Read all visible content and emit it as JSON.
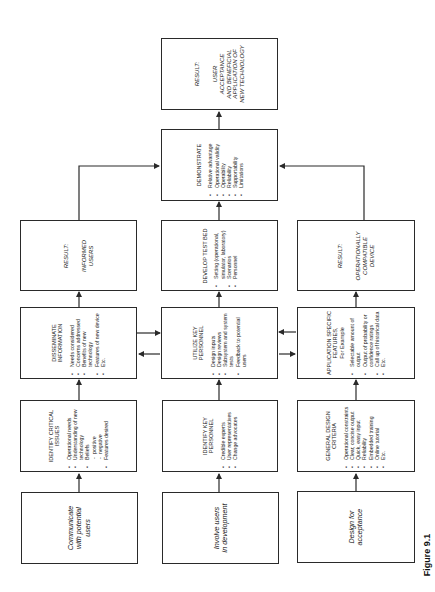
{
  "figure": {
    "orientation": "rotated 90 degrees counter-clockwise",
    "caption": "Figure 9.1"
  },
  "boxes": {
    "final_result": {
      "label": "RESULT:",
      "text": [
        "USER",
        "ACCEPTANCE",
        "AND BENEFICIAL",
        "APPLICATION OF",
        "NEW TECHNOLOGY"
      ]
    },
    "demonstrate": {
      "title": "DEMONSTRATE",
      "items": [
        "Relative advantage",
        "Operational validity",
        "Operability",
        "Reliability",
        "Supportability",
        "Limitations"
      ]
    },
    "result_informed": {
      "label": "RESULT:",
      "text": [
        "INFORMED",
        "USERS"
      ]
    },
    "develop_test_bed": {
      "title": "DEVELOP TEST BED",
      "items": [
        "Setting (operational, simulator, laboratory)",
        "Scenarios",
        "Personnel"
      ]
    },
    "result_compatible": {
      "label": "RESULT:",
      "text": [
        "OPERATIONALLY",
        "COMPATIBLE",
        "DEVICE"
      ]
    },
    "disseminate": {
      "title": "DISSEMINATE INFORMATION",
      "items": [
        "Needs considered",
        "Concerns addressed",
        "Benefits of new technology",
        "Features of new device",
        "Etc."
      ]
    },
    "utilize_key": {
      "title": "UTILIZE KEY PERSONNEL",
      "items": [
        "Design inputs",
        "Design reviews",
        "Subsystem and system tests",
        "Feedback to potential users"
      ]
    },
    "application_features": {
      "title": "APPLICATION SPECIFIC FEATURES,",
      "subtitle": "For Example",
      "items": [
        "Selectable amount of output",
        "Output of probability or confidence ratings",
        "Call up of historical data",
        "Etc."
      ]
    },
    "identify_issues": {
      "title": "IDENTIFY CRITICAL ISSUES",
      "items": [
        "Operational needs",
        "Understanding of new technology",
        "Beliefs"
      ],
      "subitems": [
        "positive",
        "negative"
      ],
      "items_after": [
        "Features desired"
      ]
    },
    "identify_personnel": {
      "title": "IDENTIFY KEY PERSONNEL",
      "items": [
        "Credible experts",
        "User representatives",
        "Change advocates"
      ]
    },
    "general_design": {
      "title": "GENERAL DESIGN CRITERIA",
      "items": [
        "Operational constraints",
        "Clear, concise output",
        "Quick, easy input",
        "Reliability",
        "Embedded training",
        "Online tutorial",
        "Etc."
      ]
    },
    "communicate": {
      "text": [
        "Communicate",
        "with potential",
        "users"
      ]
    },
    "involve": {
      "text": [
        "Involve users",
        "in development"
      ]
    },
    "design_acceptance": {
      "text": [
        "Design for",
        "acceptance"
      ]
    }
  },
  "colors": {
    "line": "#2a2a2a",
    "background": "#ffffff"
  }
}
